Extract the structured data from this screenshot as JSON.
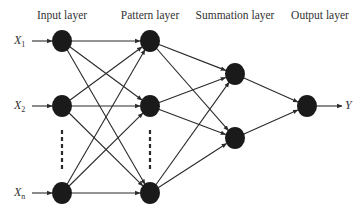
{
  "diagram": {
    "type": "neural-network",
    "layers": [
      {
        "label": "Input layer",
        "x": 62,
        "nodes": [
          41,
          106,
          193
        ],
        "ellipsis": true
      },
      {
        "label": "Pattern layer",
        "x": 150,
        "nodes": [
          41,
          106,
          193
        ],
        "ellipsis": true
      },
      {
        "label": "Summation layer",
        "x": 235,
        "nodes": [
          74,
          138
        ],
        "ellipsis": false
      },
      {
        "label": "Output layer",
        "x": 307,
        "nodes": [
          106
        ],
        "ellipsis": false
      }
    ],
    "inputs": [
      {
        "base": "X",
        "sub": "1",
        "y": 41
      },
      {
        "base": "X",
        "sub": "2",
        "y": 106
      },
      {
        "base": "X",
        "sub": "n",
        "y": 193
      }
    ],
    "output": {
      "label": "Y",
      "y": 106
    },
    "colors": {
      "node": "#1a1a1a",
      "edge": "#2a2a2a",
      "text": "#333333"
    }
  }
}
